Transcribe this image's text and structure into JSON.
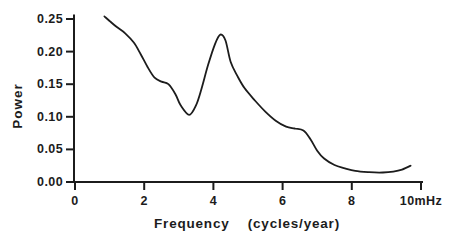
{
  "figure": {
    "background": "#ffffff",
    "ink_color": "#1c1c1c"
  },
  "chart_data": {
    "type": "line",
    "title": "",
    "xlabel": "Frequency    (cycles/year)",
    "ylabel": "Power",
    "xlim": [
      0,
      10
    ],
    "ylim": [
      0,
      0.25
    ],
    "grid": false,
    "legend": null,
    "x_ticks": [
      0,
      2,
      4,
      6,
      8,
      10
    ],
    "x_tick_labels": [
      "0",
      "2",
      "4",
      "6",
      "8",
      "10mHz"
    ],
    "y_ticks": [
      0,
      0.05,
      0.1,
      0.15,
      0.2,
      0.25
    ],
    "y_tick_labels": [
      "0.00",
      "0.05",
      "0.10",
      "0.15",
      "0.20",
      "0.25"
    ],
    "series": [
      {
        "name": "power-spectrum",
        "color": "#1c1c1c",
        "points": [
          [
            0.85,
            0.254
          ],
          [
            1.0,
            0.247
          ],
          [
            1.2,
            0.238
          ],
          [
            1.45,
            0.228
          ],
          [
            1.7,
            0.214
          ],
          [
            1.9,
            0.196
          ],
          [
            2.1,
            0.176
          ],
          [
            2.3,
            0.16
          ],
          [
            2.5,
            0.154
          ],
          [
            2.7,
            0.15
          ],
          [
            2.9,
            0.135
          ],
          [
            3.05,
            0.118
          ],
          [
            3.3,
            0.103
          ],
          [
            3.5,
            0.118
          ],
          [
            3.65,
            0.142
          ],
          [
            3.85,
            0.18
          ],
          [
            4.05,
            0.212
          ],
          [
            4.2,
            0.226
          ],
          [
            4.35,
            0.217
          ],
          [
            4.5,
            0.184
          ],
          [
            4.7,
            0.162
          ],
          [
            4.9,
            0.144
          ],
          [
            5.2,
            0.125
          ],
          [
            5.5,
            0.108
          ],
          [
            5.8,
            0.094
          ],
          [
            6.1,
            0.085
          ],
          [
            6.35,
            0.082
          ],
          [
            6.6,
            0.079
          ],
          [
            6.8,
            0.066
          ],
          [
            7.0,
            0.048
          ],
          [
            7.2,
            0.036
          ],
          [
            7.5,
            0.026
          ],
          [
            7.8,
            0.021
          ],
          [
            8.1,
            0.017
          ],
          [
            8.5,
            0.015
          ],
          [
            8.9,
            0.0145
          ],
          [
            9.2,
            0.016
          ],
          [
            9.45,
            0.019
          ],
          [
            9.7,
            0.025
          ]
        ]
      }
    ]
  }
}
